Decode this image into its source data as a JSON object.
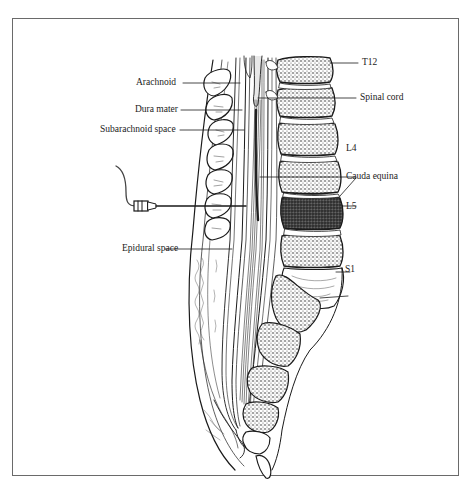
{
  "figure": {
    "type": "anatomical-illustration",
    "frame_color": "#6a6a6a",
    "ink_color": "#1a1a1a"
  },
  "labels": {
    "left": [
      {
        "id": "arachnoid",
        "text": "Arachnoid"
      },
      {
        "id": "dura_mater",
        "text": "Dura mater"
      },
      {
        "id": "subarachnoid_space",
        "text": "Subarachnoid space"
      },
      {
        "id": "epidural_space",
        "text": "Epidural space"
      }
    ],
    "right": [
      {
        "id": "t12",
        "text": "T12"
      },
      {
        "id": "spinal_cord",
        "text": "Spinal cord"
      },
      {
        "id": "l4",
        "text": "L4"
      },
      {
        "id": "cauda_equina",
        "text": "Cauda equina"
      },
      {
        "id": "l5",
        "text": "L5"
      },
      {
        "id": "s1",
        "text": "S1"
      }
    ]
  }
}
